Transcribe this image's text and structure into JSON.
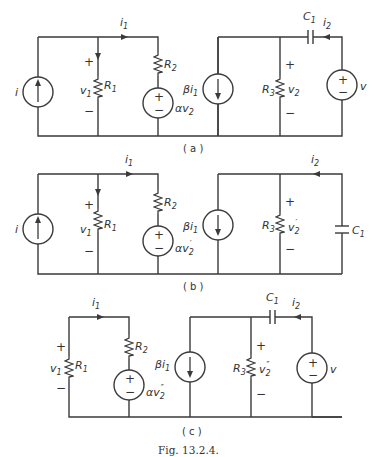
{
  "figure": {
    "caption": "Fig. 13.2.4.",
    "panels": [
      {
        "id": "a",
        "label": "( a )",
        "components": {
          "source_i": "i",
          "i1": "i",
          "i1_sub": "1",
          "v1": "v",
          "v1_sub": "1",
          "R1": "R",
          "R1_sub": "1",
          "R2": "R",
          "R2_sub": "2",
          "dep_vsrc": "αv",
          "dep_vsrc_sub": "2",
          "dep_isrc": "βi",
          "dep_isrc_sub": "1",
          "R3": "R",
          "R3_sub": "3",
          "v2": "v",
          "v2_sub": "2",
          "C1": "C",
          "C1_sub": "1",
          "i2": "i",
          "i2_sub": "2",
          "vsrc": "v",
          "plus": "+",
          "minus": "−"
        }
      },
      {
        "id": "b",
        "label": "( b )",
        "components": {
          "source_i": "i",
          "i1": "i",
          "i1_sub": "1",
          "v1": "v",
          "v1_sub": "1",
          "R1": "R",
          "R1_sub": "1",
          "R2": "R",
          "R2_sub": "2",
          "dep_vsrc": "αv",
          "dep_vsrc_sub": "2",
          "dep_vsrc_prime": "′",
          "dep_isrc": "βi",
          "dep_isrc_sub": "1",
          "R3": "R",
          "R3_sub": "3",
          "v2": "v",
          "v2_sub": "2",
          "v2_prime": "′",
          "C1": "C",
          "C1_sub": "1",
          "i2": "i",
          "i2_sub": "2",
          "plus": "+",
          "minus": "−"
        }
      },
      {
        "id": "c",
        "label": "( c )",
        "components": {
          "i1": "i",
          "i1_sub": "1",
          "v1": "v",
          "v1_sub": "1",
          "R1": "R",
          "R1_sub": "1",
          "R2": "R",
          "R2_sub": "2",
          "dep_vsrc": "αv",
          "dep_vsrc_sub": "2",
          "dep_vsrc_prime": "″",
          "dep_isrc": "βi",
          "dep_isrc_sub": "1",
          "R3": "R",
          "R3_sub": "3",
          "v2": "v",
          "v2_sub": "2",
          "v2_prime": "″",
          "C1": "C",
          "C1_sub": "1",
          "i2": "i",
          "i2_sub": "2",
          "vsrc": "v",
          "plus": "+",
          "minus": "−"
        }
      }
    ]
  }
}
